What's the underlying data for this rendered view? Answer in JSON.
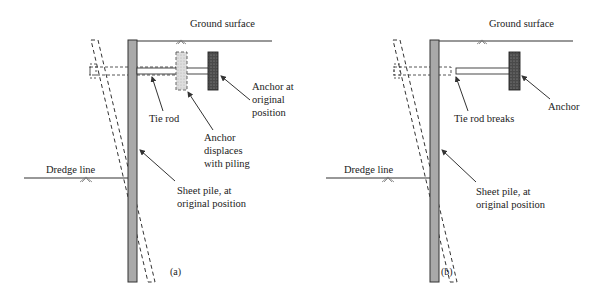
{
  "figure": {
    "panels": [
      {
        "id": "a",
        "caption": "(a)",
        "labels": {
          "ground_surface": "Ground surface",
          "dredge_line": "Dredge line",
          "tie_rod": "Tie rod",
          "anchor_original_1": "Anchor at",
          "anchor_original_2": "original",
          "anchor_original_3": "position",
          "anchor_displaced_1": "Anchor",
          "anchor_displaced_2": "displaces",
          "anchor_displaced_3": "with piling",
          "sheet_pile_1": "Sheet pile, at",
          "sheet_pile_2": "original position"
        }
      },
      {
        "id": "b",
        "caption": "(b)",
        "labels": {
          "ground_surface": "Ground surface",
          "dredge_line": "Dredge line",
          "tie_rod_breaks": "Tie rod breaks",
          "anchor": "Anchor",
          "sheet_pile_1": "Sheet pile, at",
          "sheet_pile_2": "original position"
        }
      }
    ],
    "colors": {
      "pile_fill": "#a9a9a9",
      "anchor_fill": "#555555",
      "displaced_anchor_fill": "#d4d4d4",
      "line": "#333333"
    }
  }
}
